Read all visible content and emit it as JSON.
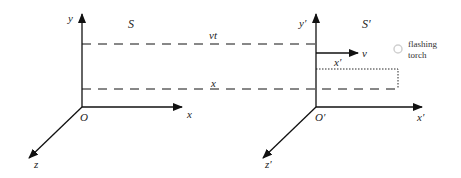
{
  "diagram": {
    "frame_s": {
      "title": "S",
      "axes": {
        "x": "x",
        "y": "y",
        "z": "z"
      },
      "origin": "O"
    },
    "frame_s_prime": {
      "title": "S′",
      "axes": {
        "x": "x′",
        "y": "y′",
        "z": "z′"
      },
      "origin": "O′",
      "velocity_label": "v",
      "offset_label": "x′"
    },
    "dashed_lines": {
      "upper_label": "vt",
      "lower_label": "x"
    },
    "torch": {
      "line1": "flashing",
      "line2": "torch"
    },
    "colors": {
      "ink": "#111111",
      "torch": "#d8d8d8"
    }
  }
}
